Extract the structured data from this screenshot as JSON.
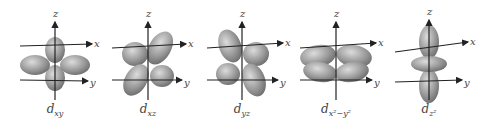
{
  "figure": {
    "axis_labels": {
      "z": "z",
      "x": "x",
      "y": "y"
    },
    "orbitals": [
      {
        "name": "d",
        "subscript": "xy",
        "cx": 55
      },
      {
        "name": "d",
        "subscript": "xz",
        "cx": 148
      },
      {
        "name": "d",
        "subscript": "yz",
        "cx": 242
      },
      {
        "name": "d",
        "subscript": "x²−y²",
        "cx": 336
      },
      {
        "name": "d",
        "subscript": "z²",
        "cx": 429
      }
    ],
    "colors": {
      "lobe": "#8a8a8a",
      "lobe_highlight": "#d0d0d0",
      "axis": "#222222",
      "label": "#444444"
    }
  }
}
